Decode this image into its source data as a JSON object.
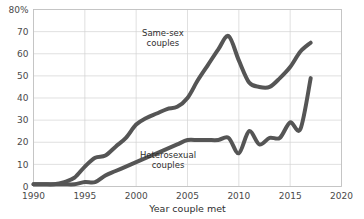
{
  "chart_data": {
    "type": "line",
    "title": "",
    "xlabel": "Year couple met",
    "ylabel": "",
    "xlim": [
      1990,
      2020
    ],
    "ylim": [
      0,
      80
    ],
    "xticks": [
      1990,
      1995,
      2000,
      2005,
      2010,
      2015,
      2020
    ],
    "yticks": [
      0,
      10,
      20,
      30,
      40,
      50,
      60,
      70,
      80
    ],
    "ytick_labels": [
      "0",
      "10",
      "20",
      "30",
      "40",
      "50",
      "60",
      "70",
      "80%"
    ],
    "xtick_labels": [
      "1990",
      "1995",
      "2000",
      "2005",
      "2010",
      "2015",
      "2020"
    ],
    "grid": true,
    "legend_position": "inline-annotation",
    "line_color": "#555555",
    "line_width": 4,
    "series": [
      {
        "name": "Same-sex couples",
        "label_lines": [
          "Same-sex",
          "couples"
        ],
        "label_x": 2002.6,
        "label_y": 68,
        "x": [
          1990,
          1991,
          1992,
          1993,
          1994,
          1995,
          1996,
          1997,
          1998,
          1999,
          2000,
          2001,
          2002,
          2003,
          2004,
          2005,
          2006,
          2007,
          2008,
          2009,
          2010,
          2011,
          2012,
          2013,
          2014,
          2015,
          2016,
          2017
        ],
        "values": [
          1,
          1,
          1,
          2,
          4,
          9,
          13,
          14,
          18,
          22,
          28,
          31,
          33,
          35,
          36,
          40,
          48,
          55,
          62,
          68,
          57,
          47,
          45,
          45,
          49,
          54,
          61,
          65
        ]
      },
      {
        "name": "Heterosexual couples",
        "label_lines": [
          "Heterosexual",
          "couples"
        ],
        "label_x": 2003.1,
        "label_y": 13,
        "x": [
          1990,
          1991,
          1992,
          1993,
          1994,
          1995,
          1996,
          1997,
          1998,
          1999,
          2000,
          2001,
          2002,
          2003,
          2004,
          2005,
          2006,
          2007,
          2008,
          2009,
          2010,
          2011,
          2012,
          2013,
          2014,
          2015,
          2016,
          2017
        ],
        "values": [
          1,
          1,
          1,
          1,
          1,
          2,
          2,
          5,
          7,
          9,
          11,
          13,
          15,
          17,
          19,
          21,
          21,
          21,
          21,
          22,
          15,
          25,
          19,
          22,
          22,
          29,
          26,
          49
        ]
      }
    ]
  }
}
